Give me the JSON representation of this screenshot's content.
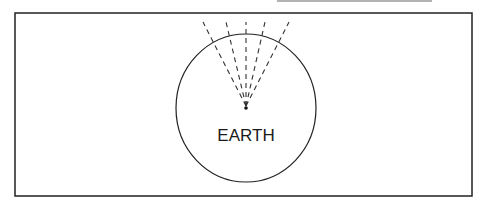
{
  "diagram": {
    "label": "EARTH",
    "center": {
      "x": 246,
      "y": 108
    },
    "radius": 71,
    "ray_count": 5,
    "colors": {
      "line": "#222222",
      "background": "#ffffff"
    }
  }
}
